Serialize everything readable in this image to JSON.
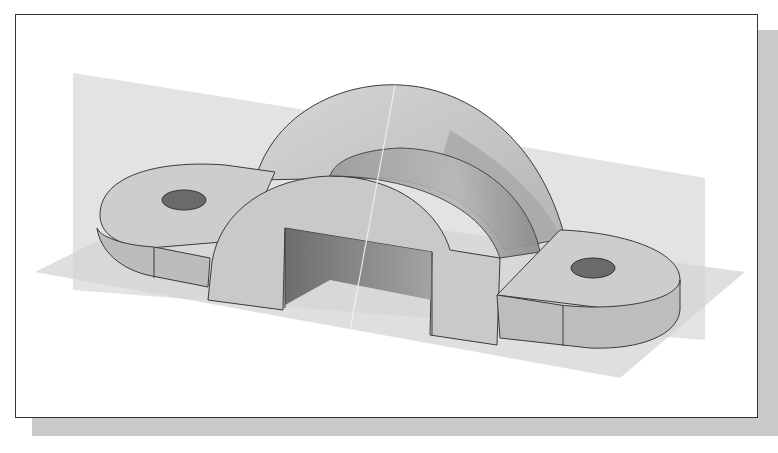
{
  "figure": {
    "render_style": "shaded grayscale isometric with datum planes",
    "colors": {
      "frame_border": "#333333",
      "shadow": "#c9c9c9",
      "datum_plane": "#d8d8d8",
      "face_light": "#d2d2d2",
      "face_mid": "#bdbdbd",
      "face_dark": "#8a8a8a",
      "hole": "#6a6a6a",
      "edge": "#3a3a3a"
    },
    "features": [
      "datum-plane-vertical",
      "datum-plane-horizontal",
      "arch-body",
      "rectangular-cutout",
      "left-lug",
      "right-lug",
      "left-hole",
      "right-hole"
    ]
  }
}
